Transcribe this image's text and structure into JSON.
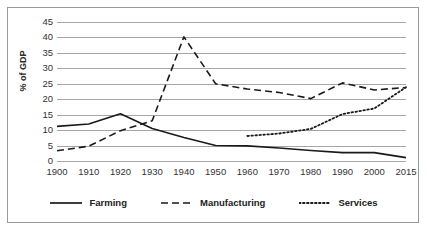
{
  "chart_data": {
    "type": "line",
    "title": "",
    "xlabel": "",
    "ylabel": "% of GDP",
    "ylim": [
      0,
      45
    ],
    "yticks": [
      0,
      5,
      10,
      15,
      20,
      25,
      30,
      35,
      40,
      45
    ],
    "grid": true,
    "legend_position": "bottom",
    "categories": [
      "1900",
      "1910",
      "1920",
      "1930",
      "1940",
      "1950",
      "1960",
      "1970",
      "1980",
      "1990",
      "2000",
      "2015"
    ],
    "series": [
      {
        "name": "Farming",
        "style": "solid",
        "color": "#1a1a1a",
        "values": [
          11.2,
          12.0,
          15.3,
          10.5,
          7.6,
          5.0,
          4.9,
          4.2,
          3.4,
          2.7,
          2.7,
          1.1
        ]
      },
      {
        "name": "Manufacturing",
        "style": "dashed",
        "color": "#1a1a1a",
        "values": [
          3.3,
          4.8,
          9.8,
          13.0,
          40.2,
          25.0,
          23.3,
          22.2,
          20.2,
          25.3,
          23.0,
          23.8
        ]
      },
      {
        "name": "Services",
        "style": "dotted",
        "color": "#1a1a1a",
        "values": [
          null,
          null,
          null,
          null,
          null,
          null,
          8.1,
          8.9,
          10.4,
          15.2,
          17.0,
          23.9
        ]
      }
    ],
    "annotations": []
  },
  "legend": {
    "items": [
      {
        "label": "Farming",
        "marker": "solid-line-swatch"
      },
      {
        "label": "Manufacturing",
        "marker": "dashed-line-swatch"
      },
      {
        "label": "Services",
        "marker": "dotted-line-swatch"
      }
    ]
  }
}
